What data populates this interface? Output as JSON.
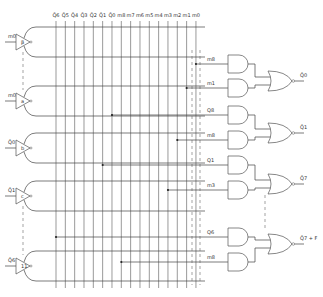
{
  "diagram": {
    "title": "",
    "column_labels": [
      "Q̄6",
      "Q̄5",
      "Q̄4",
      "Q̄3",
      "Q̄2",
      "Q̄1",
      "Q̄0",
      "m8",
      "m7",
      "m6",
      "m5",
      "m4",
      "m3",
      "m2",
      "m1",
      "m0"
    ],
    "buffers": [
      {
        "input_label": "m0",
        "symbol": "β",
        "y": 42
      },
      {
        "input_label": "m0",
        "symbol": "a",
        "y": 101
      },
      {
        "input_label": "Q̄0",
        "symbol": "b",
        "y": 148
      },
      {
        "input_label": "Q̄1",
        "symbol": "c",
        "y": 196
      },
      {
        "input_label": "Q̄6",
        "symbol": "11",
        "y": 266
      }
    ],
    "and_inputs": [
      {
        "label": "m8",
        "y": 64,
        "col": 15
      },
      {
        "label": "m1",
        "y": 88,
        "col": 14
      },
      {
        "label": "Q8",
        "y": 115,
        "col": 6
      },
      {
        "label": "m8",
        "y": 140,
        "col": 13
      },
      {
        "label": "Q1",
        "y": 165,
        "col": 5
      },
      {
        "label": "m3",
        "y": 190,
        "col": 12
      },
      {
        "label": "Q6",
        "y": 237,
        "col": 0
      },
      {
        "label": "m8",
        "y": 262,
        "col": 7
      }
    ],
    "or_outputs": [
      {
        "label": "Q̄0",
        "y": 81
      },
      {
        "label": "Q̄1",
        "y": 133
      },
      {
        "label": "Q̄7",
        "y": 184
      },
      {
        "label": "Q̄7 + F",
        "y": 244
      }
    ]
  }
}
